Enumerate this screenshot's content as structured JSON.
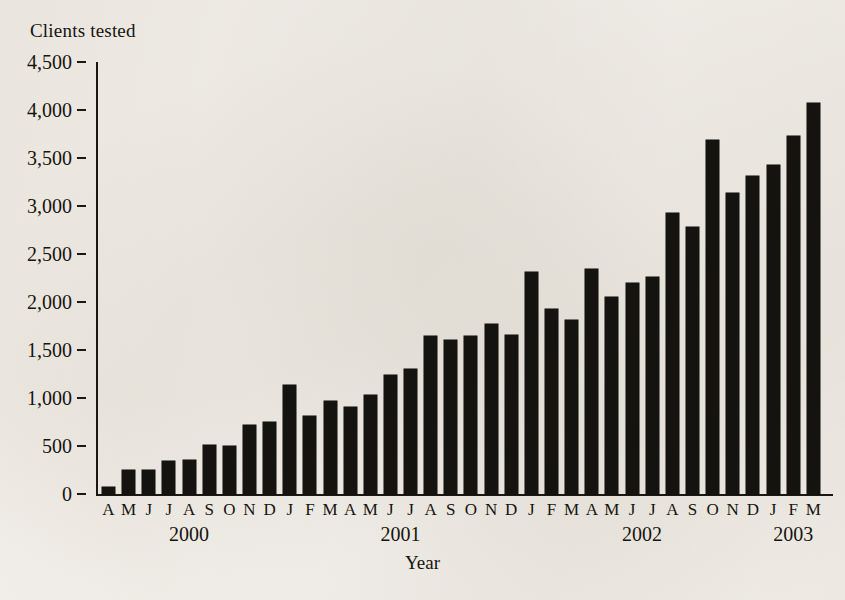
{
  "chart_data": {
    "type": "bar",
    "title": "Clients tested",
    "xlabel": "Year",
    "ylabel": "Clients tested",
    "ylim": [
      0,
      4500
    ],
    "ytick_values": [
      0,
      500,
      1000,
      1500,
      2000,
      2500,
      3000,
      3500,
      4000,
      4500
    ],
    "ytick_labels": [
      "0",
      "500",
      "1,000",
      "1,500",
      "2,000",
      "2,500",
      "3,000",
      "3,500",
      "4,000",
      "4,500"
    ],
    "grid": false,
    "legend": null,
    "bar_color": "#151310",
    "background_color": "#f7f5f1",
    "categories": [
      "A",
      "M",
      "J",
      "J",
      "A",
      "S",
      "O",
      "N",
      "D",
      "J",
      "F",
      "M",
      "A",
      "M",
      "J",
      "J",
      "A",
      "S",
      "O",
      "N",
      "D",
      "J",
      "F",
      "M",
      "A",
      "M",
      "J",
      "J",
      "A",
      "S",
      "O",
      "N",
      "D",
      "J",
      "F",
      "M"
    ],
    "year_groups": [
      {
        "label": "2000",
        "start_index": 0,
        "end_index": 8
      },
      {
        "label": "2001",
        "start_index": 9,
        "end_index": 20
      },
      {
        "label": "2002",
        "start_index": 21,
        "end_index": 32
      },
      {
        "label": "2003",
        "start_index": 33,
        "end_index": 35
      }
    ],
    "values": [
      70,
      255,
      245,
      345,
      355,
      515,
      495,
      720,
      745,
      1135,
      815,
      965,
      905,
      1035,
      1240,
      1305,
      1650,
      1605,
      1645,
      1770,
      1660,
      2310,
      1930,
      1810,
      2345,
      2055,
      2200,
      2265,
      2930,
      2785,
      3690,
      3140,
      3310,
      3430,
      3725,
      4070
    ]
  }
}
